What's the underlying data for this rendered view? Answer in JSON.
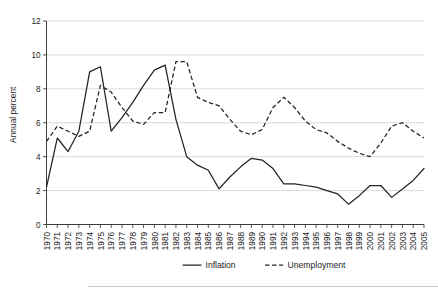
{
  "chart_data": {
    "type": "line",
    "title": "",
    "xlabel": "",
    "ylabel": "Annual percent",
    "ylim": [
      0,
      12
    ],
    "ytick_values": [
      0,
      2,
      4,
      6,
      8,
      10,
      12
    ],
    "ytick_labels": [
      "0",
      "2",
      "4",
      "6",
      "8",
      "10",
      "12"
    ],
    "grid": true,
    "legend_position": "bottom",
    "x": [
      1970,
      1971,
      1972,
      1973,
      1974,
      1975,
      1976,
      1977,
      1978,
      1979,
      1980,
      1981,
      1982,
      1983,
      1984,
      1985,
      1986,
      1987,
      1988,
      1989,
      1990,
      1991,
      1992,
      1993,
      1994,
      1995,
      1996,
      1997,
      1998,
      1999,
      2000,
      2001,
      2002,
      2003,
      2004,
      2005
    ],
    "categories": [
      "1970",
      "1971",
      "1972",
      "1973",
      "1974",
      "1975",
      "1976",
      "1977",
      "1978",
      "1979",
      "1980",
      "1981",
      "1982",
      "1983",
      "1984",
      "1985",
      "1986",
      "1987",
      "1988",
      "1989",
      "1990",
      "1991",
      "1992",
      "1993",
      "1994",
      "1995",
      "1996",
      "1997",
      "1998",
      "1999",
      "2000",
      "2001",
      "2002",
      "2003",
      "2004",
      "2005"
    ],
    "series": [
      {
        "name": "Inflation",
        "style": "solid",
        "values": [
          2.2,
          5.1,
          4.3,
          5.5,
          9.0,
          9.3,
          5.5,
          6.3,
          7.2,
          8.2,
          9.1,
          9.4,
          6.2,
          4.0,
          3.5,
          3.2,
          2.1,
          2.8,
          3.4,
          3.9,
          3.8,
          3.3,
          2.4,
          2.4,
          2.3,
          2.2,
          2.0,
          1.8,
          1.2,
          1.7,
          2.3,
          2.3,
          1.6,
          2.1,
          2.6,
          3.3
        ]
      },
      {
        "name": "Unemployment",
        "style": "dashed",
        "values": [
          4.9,
          5.8,
          5.5,
          5.2,
          5.5,
          8.2,
          7.8,
          6.9,
          6.1,
          5.9,
          6.6,
          6.6,
          9.6,
          9.6,
          7.5,
          7.2,
          7.0,
          6.2,
          5.5,
          5.3,
          5.6,
          6.9,
          7.5,
          6.9,
          6.1,
          5.6,
          5.4,
          4.9,
          4.5,
          4.2,
          4.0,
          4.8,
          5.8,
          6.0,
          5.5,
          5.1
        ]
      }
    ],
    "legend": [
      {
        "label": "Inflation",
        "style": "solid"
      },
      {
        "label": "Unemployment",
        "style": "dashed"
      }
    ]
  }
}
